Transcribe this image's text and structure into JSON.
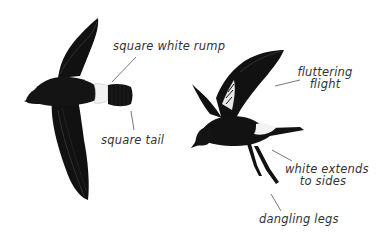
{
  "figure": {
    "colors": {
      "background": "#ffffff",
      "plumage": "#111111",
      "plumage_highlight": "#3a3a3a",
      "rump": "#f2f2f2",
      "label_text": "#333333",
      "leader_line": "#555555"
    },
    "birds": [
      {
        "name": "bird-top-view",
        "description": "bird in flight seen from above, wings spread"
      },
      {
        "name": "bird-side-view",
        "description": "bird fluttering with legs dangling"
      }
    ],
    "annotations": [
      {
        "id": "square-white-rump",
        "text": "square white rump"
      },
      {
        "id": "square-tail",
        "text": "square tail"
      },
      {
        "id": "fluttering-flight",
        "lines": [
          "fluttering",
          "flight"
        ]
      },
      {
        "id": "white-extends-to-sides",
        "lines": [
          "white extends",
          "to sides"
        ]
      },
      {
        "id": "dangling-legs",
        "text": "dangling legs"
      }
    ]
  }
}
